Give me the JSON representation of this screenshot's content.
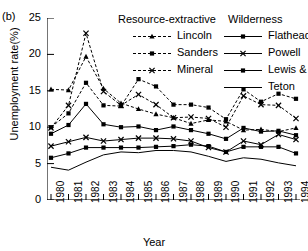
{
  "panel": {
    "label": "(b)"
  },
  "axes": {
    "ylabel": "Unemployment rate(%)",
    "xlabel": "Year",
    "yticks": [
      "0",
      "5",
      "10",
      "15",
      "20",
      "25"
    ],
    "xticks": [
      "1980",
      "1981",
      "1982",
      "1983",
      "1984",
      "1985",
      "1986",
      "1987",
      "1988",
      "1989",
      "1990",
      "1991",
      "1992",
      "1993",
      "1994"
    ]
  },
  "legend": {
    "group1_title": "Resource-extractive",
    "group2_title": "Wilderness",
    "entries": [
      {
        "label": "Lincoln",
        "group": 1,
        "dash": true,
        "marker": "triangle"
      },
      {
        "label": "Sanders",
        "group": 1,
        "dash": true,
        "marker": "square"
      },
      {
        "label": "Mineral",
        "group": 1,
        "dash": true,
        "marker": "cross"
      },
      {
        "label": "Flathead",
        "group": 2,
        "dash": false,
        "marker": "square"
      },
      {
        "label": "Powell",
        "group": 2,
        "dash": false,
        "marker": "cross"
      },
      {
        "label": "Lewis & Clark",
        "group": 2,
        "dash": false,
        "marker": "square"
      },
      {
        "label": "Teton",
        "group": 2,
        "dash": false,
        "marker": "none"
      }
    ]
  },
  "chart_data": {
    "type": "line",
    "title": "",
    "xlabel": "Year",
    "ylabel": "Unemployment rate(%)",
    "xlim": [
      1980,
      1994
    ],
    "ylim": [
      0,
      25
    ],
    "grid": false,
    "legend_position": "top",
    "x": [
      1980,
      1981,
      1982,
      1983,
      1984,
      1985,
      1986,
      1987,
      1988,
      1989,
      1990,
      1991,
      1992,
      1993,
      1994
    ],
    "series": [
      {
        "name": "Lincoln",
        "group": "Resource-extractive",
        "dash": true,
        "marker": "triangle",
        "values": [
          15.2,
          15.1,
          19.7,
          15.3,
          13.3,
          12.5,
          11.8,
          11.3,
          10.5,
          11.0,
          10.8,
          9.6,
          9.7,
          9.4,
          9.9
        ]
      },
      {
        "name": "Sanders",
        "group": "Resource-extractive",
        "dash": true,
        "marker": "square",
        "values": [
          10.0,
          11.9,
          16.1,
          13.0,
          12.9,
          16.6,
          15.6,
          13.1,
          13.1,
          12.7,
          11.1,
          15.2,
          13.5,
          14.6,
          13.9
        ]
      },
      {
        "name": "Mineral",
        "group": "Resource-extractive",
        "dash": true,
        "marker": "cross",
        "values": [
          9.9,
          13.0,
          22.9,
          14.9,
          13.0,
          14.5,
          13.1,
          11.3,
          11.4,
          11.2,
          10.0,
          14.3,
          13.1,
          13.0,
          11.2
        ]
      },
      {
        "name": "Flathead",
        "group": "Wilderness",
        "dash": false,
        "marker": "square",
        "values": [
          9.1,
          10.3,
          13.2,
          10.4,
          10.0,
          10.1,
          9.6,
          10.1,
          9.6,
          9.1,
          8.4,
          9.9,
          9.4,
          9.5,
          8.9
        ]
      },
      {
        "name": "Powell",
        "group": "Wilderness",
        "dash": false,
        "marker": "cross",
        "values": [
          7.4,
          8.0,
          8.6,
          8.1,
          8.3,
          8.5,
          8.5,
          8.4,
          8.1,
          7.2,
          6.6,
          8.1,
          7.6,
          9.0,
          8.3
        ]
      },
      {
        "name": "Lewis & Clark",
        "group": "Wilderness",
        "dash": false,
        "marker": "square",
        "values": [
          5.8,
          6.4,
          7.2,
          7.2,
          7.2,
          7.2,
          7.3,
          7.4,
          7.6,
          7.4,
          6.6,
          7.3,
          7.3,
          7.3,
          6.4
        ]
      },
      {
        "name": "Teton",
        "group": "Wilderness",
        "dash": false,
        "marker": "none",
        "values": [
          4.5,
          4.1,
          5.2,
          6.2,
          6.6,
          6.5,
          6.8,
          6.8,
          6.6,
          6.0,
          5.3,
          5.8,
          5.6,
          5.1,
          4.7
        ]
      }
    ]
  }
}
